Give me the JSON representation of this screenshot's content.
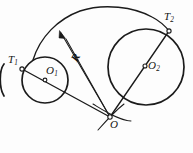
{
  "figure": {
    "type": "geometry-diagram",
    "background_color": "#fdfdfd",
    "stroke_color": "#1b1b1b",
    "labels": {
      "tangent_point_1": {
        "base": "T",
        "sub": "1"
      },
      "tangent_point_2": {
        "base": "T",
        "sub": "2"
      },
      "center_1": {
        "base": "O",
        "sub": "1"
      },
      "center_2": {
        "base": "O",
        "sub": "2"
      },
      "apex": {
        "base": "O",
        "sub": ""
      },
      "radius": {
        "base": "R",
        "sub": ""
      }
    },
    "points": {
      "T1": {
        "x": 22,
        "y": 69,
        "name": "tangent-point-T1"
      },
      "T2": {
        "x": 169,
        "y": 31,
        "name": "tangent-point-T2"
      },
      "O1": {
        "x": 45,
        "y": 80,
        "name": "circle-1-center"
      },
      "O2": {
        "x": 145,
        "y": 66,
        "name": "circle-2-center"
      },
      "O": {
        "x": 110,
        "y": 117,
        "name": "angle-apex"
      },
      "arrow_tip": {
        "x": 60,
        "y": 31,
        "name": "radius-arrow-tip"
      }
    },
    "circles": [
      {
        "name": "small-circle",
        "cx": 45,
        "cy": 80,
        "r": 23
      },
      {
        "name": "large-circle",
        "cx": 146,
        "cy": 67,
        "r": 38
      }
    ],
    "arcs": [
      {
        "name": "radius-arc",
        "description": "large arc of radius R from near T1 up over the top to T2"
      },
      {
        "name": "apex-tangent-arc",
        "description": "short tangent arc through apex O"
      }
    ],
    "segments": [
      {
        "name": "ray-O-to-T1",
        "from": "O",
        "to": "T1"
      },
      {
        "name": "ray-O-to-T2",
        "from": "O",
        "to": "T2"
      },
      {
        "name": "radius-line-R",
        "from": "O",
        "to": "arrow_tip"
      }
    ]
  }
}
